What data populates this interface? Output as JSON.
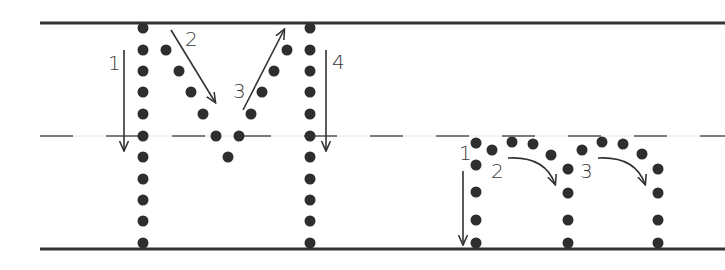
{
  "worksheet": {
    "title": "Letter tracing: M and m",
    "colors": {
      "ink": "#2e2e2e",
      "guide": "#333333",
      "midline": "#555555",
      "background": "#ffffff"
    },
    "guides": {
      "top_y": 23,
      "mid_y": 136,
      "bottom_y": 248,
      "start_x": 40,
      "end_x": 725
    },
    "letters": [
      {
        "name": "uppercase-M",
        "character": "M",
        "strokes": [
          {
            "number": "1",
            "label_x": 108,
            "label_y": 53,
            "direction": "down"
          },
          {
            "number": "2",
            "label_x": 185,
            "label_y": 29,
            "direction": "down-right"
          },
          {
            "number": "3",
            "label_x": 233,
            "label_y": 81,
            "direction": "up-right"
          },
          {
            "number": "4",
            "label_x": 332,
            "label_y": 52,
            "direction": "down"
          }
        ]
      },
      {
        "name": "lowercase-m",
        "character": "m",
        "strokes": [
          {
            "number": "1",
            "label_x": 459,
            "label_y": 143,
            "direction": "down"
          },
          {
            "number": "2",
            "label_x": 491,
            "label_y": 161,
            "direction": "arc-right-down"
          },
          {
            "number": "3",
            "label_x": 580,
            "label_y": 161,
            "direction": "arc-right-down"
          }
        ]
      }
    ]
  }
}
